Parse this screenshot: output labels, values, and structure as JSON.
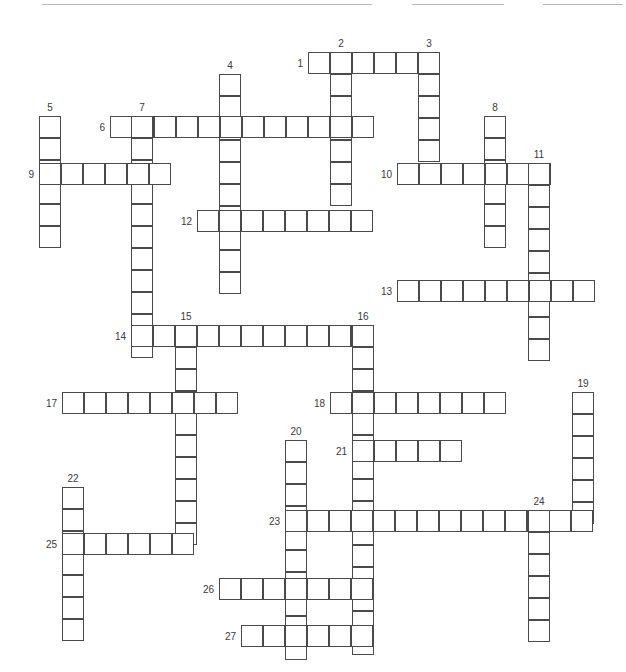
{
  "page": {
    "width": 626,
    "height": 672,
    "background_color": "#ffffff"
  },
  "grid": {
    "cell_size": 22,
    "cell_border_color": "#4a4a4a",
    "cell_fill_color": "#ffffff",
    "number_color": "#3a3a3a",
    "number_font_size": 10,
    "origin_note": "All coordinates are absolute pixel positions of each cell's top-left corner."
  },
  "decorations": {
    "top_rules": [
      {
        "name": "top-rule-left",
        "x": 42,
        "y": 4,
        "width": 330,
        "color": "#b9b9b9"
      },
      {
        "name": "top-rule-middle",
        "x": 412,
        "y": 4,
        "width": 92,
        "color": "#b9b9b9"
      },
      {
        "name": "top-rule-right",
        "x": 543,
        "y": 4,
        "width": 80,
        "color": "#b9b9b9"
      }
    ]
  },
  "entries": [
    {
      "number": "1",
      "direction": "across",
      "length": 6,
      "x": 308,
      "y": 52,
      "label_x": 303,
      "label_y": 58,
      "label_pos": "left"
    },
    {
      "number": "2",
      "direction": "down",
      "length": 7,
      "x": 330,
      "y": 52,
      "label_x": 341,
      "label_y": 38,
      "label_pos": "above"
    },
    {
      "number": "3",
      "direction": "down",
      "length": 5,
      "x": 418,
      "y": 52,
      "label_x": 429,
      "label_y": 38,
      "label_pos": "above"
    },
    {
      "number": "4",
      "direction": "down",
      "length": 10,
      "x": 219,
      "y": 74,
      "label_x": 230,
      "label_y": 60,
      "label_pos": "above"
    },
    {
      "number": "5",
      "direction": "down",
      "length": 6,
      "x": 39,
      "y": 116,
      "label_x": 50,
      "label_y": 102,
      "label_pos": "above"
    },
    {
      "number": "6",
      "direction": "across",
      "length": 12,
      "x": 110,
      "y": 116,
      "label_x": 105,
      "label_y": 122,
      "label_pos": "left"
    },
    {
      "number": "7",
      "direction": "down",
      "length": 11,
      "x": 131,
      "y": 116,
      "label_x": 142,
      "label_y": 102,
      "label_pos": "above"
    },
    {
      "number": "8",
      "direction": "down",
      "length": 6,
      "x": 484,
      "y": 116,
      "label_x": 495,
      "label_y": 102,
      "label_pos": "above"
    },
    {
      "number": "9",
      "direction": "across",
      "length": 6,
      "x": 39,
      "y": 163,
      "label_x": 34,
      "label_y": 169,
      "label_pos": "left"
    },
    {
      "number": "10",
      "direction": "across",
      "length": 7,
      "x": 397,
      "y": 163,
      "label_x": 392,
      "label_y": 169,
      "label_pos": "left"
    },
    {
      "number": "11",
      "direction": "down",
      "length": 9,
      "x": 528,
      "y": 163,
      "label_x": 539,
      "label_y": 149,
      "label_pos": "above"
    },
    {
      "number": "12",
      "direction": "across",
      "length": 8,
      "x": 197,
      "y": 210,
      "label_x": 192,
      "label_y": 216,
      "label_pos": "left"
    },
    {
      "number": "13",
      "direction": "across",
      "length": 9,
      "x": 397,
      "y": 280,
      "label_x": 392,
      "label_y": 286,
      "label_pos": "left"
    },
    {
      "number": "14",
      "direction": "across",
      "length": 11,
      "x": 131,
      "y": 325,
      "label_x": 126,
      "label_y": 331,
      "label_pos": "left"
    },
    {
      "number": "15",
      "direction": "down",
      "length": 10,
      "x": 175,
      "y": 325,
      "label_x": 186,
      "label_y": 311,
      "label_pos": "above"
    },
    {
      "number": "16",
      "direction": "down",
      "length": 15,
      "x": 352,
      "y": 325,
      "label_x": 363,
      "label_y": 311,
      "label_pos": "above"
    },
    {
      "number": "17",
      "direction": "across",
      "length": 8,
      "x": 62,
      "y": 392,
      "label_x": 57,
      "label_y": 398,
      "label_pos": "left"
    },
    {
      "number": "18",
      "direction": "across",
      "length": 8,
      "x": 330,
      "y": 392,
      "label_x": 325,
      "label_y": 398,
      "label_pos": "left"
    },
    {
      "number": "19",
      "direction": "down",
      "length": 6,
      "x": 572,
      "y": 392,
      "label_x": 583,
      "label_y": 378,
      "label_pos": "above"
    },
    {
      "number": "20",
      "direction": "down",
      "length": 10,
      "x": 285,
      "y": 440,
      "label_x": 296,
      "label_y": 426,
      "label_pos": "above"
    },
    {
      "number": "21",
      "direction": "across",
      "length": 5,
      "x": 352,
      "y": 440,
      "label_x": 347,
      "label_y": 446,
      "label_pos": "left"
    },
    {
      "number": "22",
      "direction": "down",
      "length": 7,
      "x": 62,
      "y": 487,
      "label_x": 73,
      "label_y": 473,
      "label_pos": "above"
    },
    {
      "number": "23",
      "direction": "across",
      "length": 14,
      "x": 285,
      "y": 510,
      "label_x": 280,
      "label_y": 516,
      "label_pos": "left"
    },
    {
      "number": "24",
      "direction": "down",
      "length": 6,
      "x": 528,
      "y": 510,
      "label_x": 539,
      "label_y": 496,
      "label_pos": "above"
    },
    {
      "number": "25",
      "direction": "across",
      "length": 6,
      "x": 62,
      "y": 533,
      "label_x": 57,
      "label_y": 539,
      "label_pos": "left"
    },
    {
      "number": "26",
      "direction": "across",
      "length": 7,
      "x": 219,
      "y": 578,
      "label_x": 214,
      "label_y": 584,
      "label_pos": "left"
    },
    {
      "number": "27",
      "direction": "across",
      "length": 6,
      "x": 241,
      "y": 625,
      "label_x": 236,
      "label_y": 631,
      "label_pos": "left"
    }
  ]
}
